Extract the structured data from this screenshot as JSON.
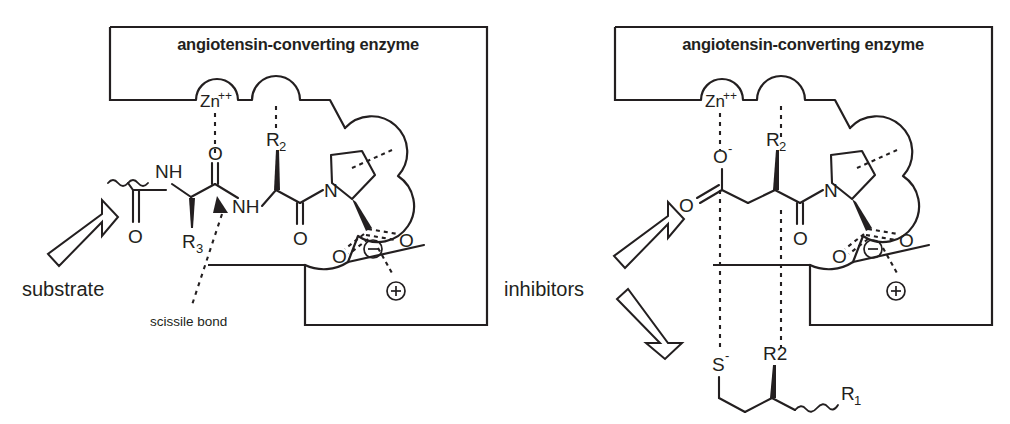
{
  "figure": {
    "type": "biochemical-mechanism-diagram",
    "panel_count": 2
  },
  "panels": [
    {
      "id": "substrate-panel",
      "enzyme_box_title": "angiotensin-converting enzyme",
      "caption": "substrate",
      "annotation": "scissile bond",
      "labels": {
        "zinc": "Zn",
        "zinc_charge": "++",
        "nh_left": "NH",
        "nh_right": "NH",
        "carbonyl_o_zinc": "O",
        "carbonyl_o_1": "O",
        "carbonyl_o_2": "O",
        "carbonyl_o_3": "O",
        "r3": "R",
        "r3_sub": "3",
        "r2": "R",
        "r2_sub": "2",
        "proline_n": "N",
        "carboxylate_o_a": "O",
        "carboxylate_o_b": "O",
        "minus_charge": "−",
        "plus_charge": "+"
      }
    },
    {
      "id": "inhibitor-panel",
      "enzyme_box_title": "angiotensin-converting enzyme",
      "caption": "inhibitors",
      "labels": {
        "zinc": "Zn",
        "zinc_charge": "++",
        "carboxylate_o_minus": "O",
        "carboxylate_o_minus_sign": "-",
        "carbonyl_o_upper": "O",
        "carbonyl_o_amide": "O",
        "r2_upper": "R",
        "r2_upper_sub": "2",
        "proline_n": "N",
        "carboxylate_o_a": "O",
        "carboxylate_o_b": "O",
        "minus_charge": "−",
        "plus_charge": "+",
        "thiolate_s": "S",
        "thiolate_sign": "-",
        "r2_lower": "R2",
        "r1": "R",
        "r1_sub": "1"
      }
    }
  ],
  "colors": {
    "ink": "#231f20",
    "background": "#ffffff"
  }
}
